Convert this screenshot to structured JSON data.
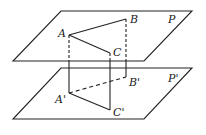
{
  "diagram": {
    "planes": [
      {
        "name": "P",
        "label": "P"
      },
      {
        "name": "P-prime",
        "label": "P'"
      }
    ],
    "points": {
      "A": "A",
      "B": "B",
      "C": "C",
      "A_prime": "A'",
      "B_prime": "B'",
      "C_prime": "C'"
    },
    "stroke_color": "#222222"
  }
}
